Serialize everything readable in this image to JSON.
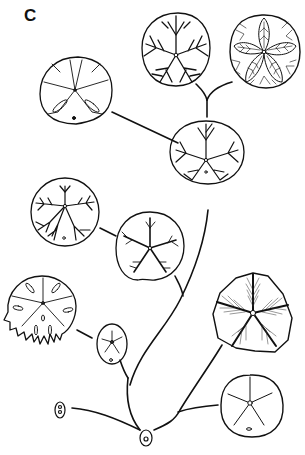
{
  "figure": {
    "panel_label": "C",
    "colors": {
      "ink": "#111111",
      "background": "#ffffff"
    }
  },
  "nodes": [
    {
      "id": "root-small-oval",
      "shape": "small-oval-with-pores",
      "cx": 146,
      "cy": 437
    },
    {
      "id": "left-tiny-oval",
      "shape": "tiny-oval-with-two-pores",
      "cx": 60,
      "cy": 410
    },
    {
      "id": "small-star-oval",
      "shape": "oval-with-faint-star",
      "cx": 112,
      "cy": 342
    },
    {
      "id": "petalloid-simple-right",
      "shape": "round-test-with-five-straight-rays",
      "cx": 250,
      "cy": 408
    },
    {
      "id": "shaded-pentagon",
      "shape": "pentagonal-test-with-hatched-food-grooves",
      "cx": 252,
      "cy": 320
    },
    {
      "id": "lunulate-fringed",
      "shape": "fringed-test-with-slots",
      "cx": 42,
      "cy": 308
    },
    {
      "id": "branching-five-rays",
      "shape": "round-test-with-branching-rays",
      "cx": 150,
      "cy": 246
    },
    {
      "id": "branching-lower-spread",
      "shape": "round-test-with-downward-branching-grooves",
      "cx": 65,
      "cy": 213
    },
    {
      "id": "center-branched",
      "shape": "round-test-with-dense-branching-grooves",
      "cx": 207,
      "cy": 150
    },
    {
      "id": "lunules-two-slots",
      "shape": "test-with-two-elongate-lunules",
      "cx": 75,
      "cy": 95
    },
    {
      "id": "top-dense-branching",
      "shape": "round-test-with-dense-branching-grooves",
      "cx": 176,
      "cy": 45
    },
    {
      "id": "top-ornate-petals",
      "shape": "round-test-with-ornate-leafy-petals",
      "cx": 268,
      "cy": 48
    }
  ]
}
